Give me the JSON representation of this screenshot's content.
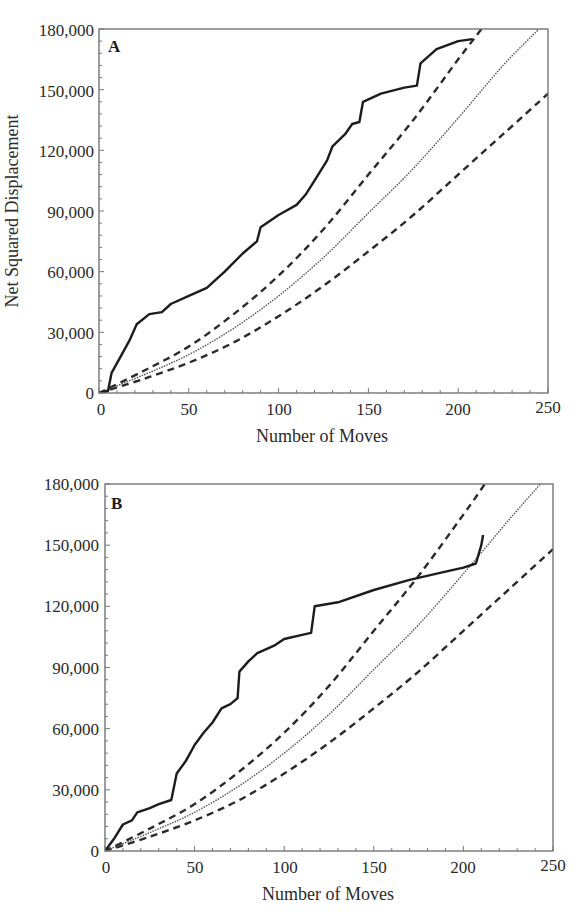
{
  "chart_data": [
    {
      "panel": "A",
      "type": "line",
      "title": "",
      "xlabel": "Number of Moves",
      "ylabel": "Net Squared Displacement",
      "xlim": [
        0,
        250
      ],
      "ylim": [
        0,
        180000
      ],
      "xticks": [
        "0",
        "50",
        "100",
        "150",
        "200",
        "250"
      ],
      "yticks": [
        "0",
        "30,000",
        "60,000",
        "90,000",
        "120,000",
        "150,000",
        "180,000"
      ],
      "grid": false,
      "legend": null,
      "series": [
        {
          "name": "observed",
          "style": "solid-thick",
          "x": [
            0,
            5,
            7,
            12,
            17,
            21,
            28,
            35,
            40,
            50,
            60,
            70,
            80,
            88,
            90,
            100,
            110,
            115,
            120,
            127,
            130,
            137,
            141,
            145,
            147,
            157,
            170,
            177,
            179,
            188,
            200,
            208
          ],
          "y": [
            0,
            1000,
            10000,
            18000,
            26000,
            34000,
            39000,
            40000,
            44000,
            48000,
            52000,
            60000,
            69000,
            75000,
            82000,
            88000,
            93000,
            98000,
            105000,
            115000,
            122000,
            128000,
            133000,
            134000,
            144000,
            148000,
            151000,
            152000,
            163000,
            170000,
            174000,
            175000
          ]
        },
        {
          "name": "expected",
          "style": "dotted-thin",
          "x": [
            0,
            25,
            50,
            75,
            100,
            125,
            150,
            175,
            200,
            225,
            245
          ],
          "y": [
            0,
            9000,
            19000,
            32000,
            48000,
            67000,
            89000,
            111000,
            136000,
            162000,
            180000
          ]
        },
        {
          "name": "upper-bound",
          "style": "dashed",
          "x": [
            0,
            25,
            50,
            75,
            100,
            125,
            150,
            175,
            200,
            213
          ],
          "y": [
            0,
            11000,
            23000,
            39000,
            58000,
            81000,
            108000,
            135000,
            165000,
            180000
          ]
        },
        {
          "name": "lower-bound",
          "style": "dashed",
          "x": [
            0,
            25,
            50,
            75,
            100,
            125,
            150,
            175,
            200,
            225,
            250
          ],
          "y": [
            0,
            7000,
            15000,
            25000,
            38000,
            53000,
            70000,
            88000,
            108000,
            128000,
            148000
          ]
        }
      ]
    },
    {
      "panel": "B",
      "type": "line",
      "title": "",
      "xlabel": "Number of Moves",
      "ylabel": "",
      "xlim": [
        0,
        250
      ],
      "ylim": [
        0,
        180000
      ],
      "xticks": [
        "0",
        "50",
        "100",
        "150",
        "200",
        "250"
      ],
      "yticks": [
        "0",
        "30,000",
        "60,000",
        "90,000",
        "120,000",
        "150,000",
        "180,000"
      ],
      "grid": false,
      "legend": null,
      "series": [
        {
          "name": "observed",
          "style": "solid-thick",
          "x": [
            0,
            5,
            10,
            15,
            18,
            25,
            30,
            37,
            40,
            45,
            50,
            55,
            60,
            65,
            70,
            74,
            75,
            80,
            85,
            90,
            95,
            100,
            110,
            115,
            117,
            130,
            150,
            170,
            190,
            200,
            207,
            210,
            211
          ],
          "y": [
            0,
            6000,
            13000,
            15000,
            19000,
            21000,
            23000,
            25000,
            38000,
            44000,
            52000,
            58000,
            63000,
            70000,
            72000,
            75000,
            88000,
            93000,
            97000,
            99000,
            101000,
            104000,
            106000,
            107000,
            120000,
            122000,
            128000,
            133000,
            137000,
            139000,
            141000,
            150000,
            155000
          ]
        },
        {
          "name": "expected",
          "style": "dotted-thin",
          "x": [
            0,
            25,
            50,
            75,
            100,
            125,
            150,
            175,
            200,
            225,
            243
          ],
          "y": [
            0,
            9000,
            19000,
            32000,
            48000,
            67000,
            89000,
            111000,
            136000,
            162000,
            180000
          ]
        },
        {
          "name": "upper-bound",
          "style": "dashed",
          "x": [
            0,
            25,
            50,
            75,
            100,
            125,
            150,
            175,
            200,
            212
          ],
          "y": [
            0,
            11000,
            23000,
            39000,
            58000,
            81000,
            108000,
            135000,
            165000,
            180000
          ]
        },
        {
          "name": "lower-bound",
          "style": "dashed",
          "x": [
            0,
            25,
            50,
            75,
            100,
            125,
            150,
            175,
            200,
            225,
            250
          ],
          "y": [
            0,
            7000,
            15000,
            25000,
            38000,
            53000,
            70000,
            88000,
            108000,
            128000,
            148000
          ]
        }
      ]
    }
  ],
  "panels": {
    "a": {
      "label": "A",
      "xlabel": "Number of Moves",
      "ylabel": "Net Squared Displacement",
      "xticks": [
        "0",
        "50",
        "100",
        "150",
        "200",
        "250"
      ],
      "yticks": [
        "0",
        "30,000",
        "60,000",
        "90,000",
        "120,000",
        "150,000",
        "180,000"
      ]
    },
    "b": {
      "label": "B",
      "xlabel": "Number of Moves",
      "xticks": [
        "0",
        "50",
        "100",
        "150",
        "200",
        "250"
      ],
      "yticks": [
        "0",
        "30,000",
        "60,000",
        "90,000",
        "120,000",
        "150,000",
        "180,000"
      ]
    }
  }
}
